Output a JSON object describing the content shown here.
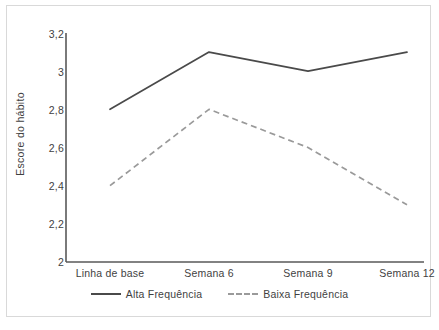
{
  "chart_data": {
    "type": "line",
    "title": "",
    "xlabel": "",
    "ylabel": "Escore do hábito",
    "categories": [
      "Linha de base",
      "Semana 6",
      "Semana 9",
      "Semana 12"
    ],
    "ylim": [
      2,
      3.2
    ],
    "yticks": [
      "2",
      "2,2",
      "2,4",
      "2,6",
      "2,8",
      "3",
      "3,2"
    ],
    "ytick_values": [
      2,
      2.2,
      2.4,
      2.6,
      2.8,
      3,
      3.2
    ],
    "grid": false,
    "legend_position": "bottom",
    "series": [
      {
        "name": "Alta Frequência",
        "values": [
          2.8,
          3.1,
          3.0,
          3.1
        ],
        "style": "solid",
        "color": "#4a4a4a"
      },
      {
        "name": "Baixa Frequência",
        "values": [
          2.4,
          2.8,
          2.6,
          2.3
        ],
        "style": "dashed",
        "color": "#9a9a9a"
      }
    ]
  },
  "axis": {
    "ylabel": "Escore do hábito",
    "yticks": [
      "3,2",
      "3",
      "2,8",
      "2,6",
      "2,4",
      "2,2",
      "2"
    ],
    "xticks": [
      "Linha de base",
      "Semana 6",
      "Semana 9",
      "Semana 12"
    ]
  },
  "legend": {
    "entries": [
      {
        "label": "Alta Frequência"
      },
      {
        "label": "Baixa Frequência"
      }
    ]
  },
  "colors": {
    "series_high": "#4a4a4a",
    "series_low": "#9a9a9a",
    "axis": "#595959",
    "text": "#3f3f3f",
    "frame_border": "#d9d9d9",
    "background": "#ffffff"
  }
}
